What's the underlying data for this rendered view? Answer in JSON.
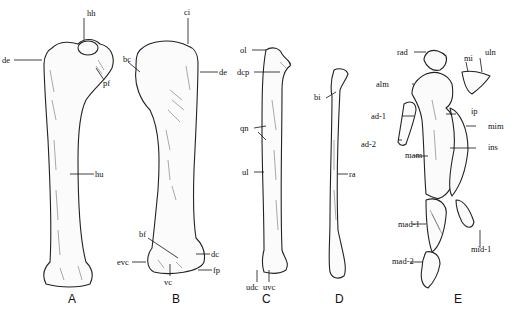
{
  "figure": {
    "panels": [
      {
        "id": "A",
        "label": "A",
        "name": "humerus-view-1",
        "annotations": [
          {
            "key": "hh",
            "text": "hh"
          },
          {
            "key": "de",
            "text": "de"
          },
          {
            "key": "pf",
            "text": "pf"
          },
          {
            "key": "hu",
            "text": "hu"
          }
        ]
      },
      {
        "id": "B",
        "label": "B",
        "name": "humerus-view-2",
        "annotations": [
          {
            "key": "ci",
            "text": "ci"
          },
          {
            "key": "bc",
            "text": "bc"
          },
          {
            "key": "de",
            "text": "de"
          },
          {
            "key": "bf",
            "text": "bf"
          },
          {
            "key": "dc",
            "text": "dc"
          },
          {
            "key": "evc",
            "text": "evc"
          },
          {
            "key": "fp",
            "text": "fp"
          },
          {
            "key": "vc",
            "text": "vc"
          }
        ]
      },
      {
        "id": "C",
        "label": "C",
        "name": "ulna",
        "annotations": [
          {
            "key": "ol",
            "text": "ol"
          },
          {
            "key": "dcp",
            "text": "dcp"
          },
          {
            "key": "qn",
            "text": "qn"
          },
          {
            "key": "ul",
            "text": "ul"
          },
          {
            "key": "udc",
            "text": "udc"
          },
          {
            "key": "uvc",
            "text": "uvc"
          }
        ]
      },
      {
        "id": "D",
        "label": "D",
        "name": "radius",
        "annotations": [
          {
            "key": "bi",
            "text": "bi"
          },
          {
            "key": "ra",
            "text": "ra"
          }
        ]
      },
      {
        "id": "E",
        "label": "E",
        "name": "manus",
        "annotations": [
          {
            "key": "rad",
            "text": "rad"
          },
          {
            "key": "uln",
            "text": "uln"
          },
          {
            "key": "mi",
            "text": "mi"
          },
          {
            "key": "alm",
            "text": "alm"
          },
          {
            "key": "ip",
            "text": "ip"
          },
          {
            "key": "mim",
            "text": "mim"
          },
          {
            "key": "ad1",
            "text": "ad-1"
          },
          {
            "key": "ad2",
            "text": "ad-2"
          },
          {
            "key": "ins",
            "text": "ins"
          },
          {
            "key": "mam",
            "text": "mam"
          },
          {
            "key": "mad1",
            "text": "mad-1"
          },
          {
            "key": "mid1",
            "text": "mid-1"
          },
          {
            "key": "mad2",
            "text": "mad-2"
          }
        ]
      }
    ]
  },
  "colors": {
    "ink": "#111111",
    "bone_fill": "#fbfbfb",
    "background": "#ffffff"
  }
}
